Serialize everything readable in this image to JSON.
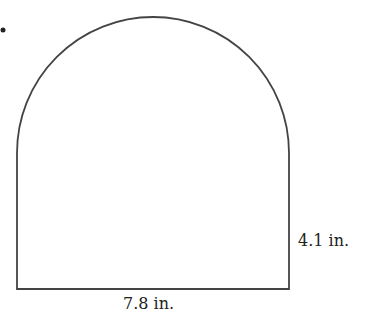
{
  "figure": {
    "bullet": "•",
    "shape": "rectangle-with-semicircle-top",
    "labels": {
      "height": "4.1 in.",
      "width": "7.8 in."
    },
    "stroke_color": "#444444"
  }
}
